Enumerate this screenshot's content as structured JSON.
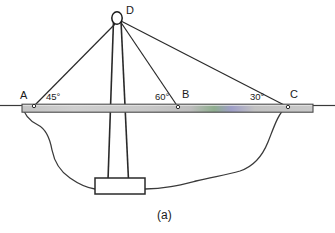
{
  "figure": {
    "caption": "(a)",
    "points": [
      {
        "id": "A",
        "label": "A",
        "x": 34,
        "y": 106,
        "label_x": 20,
        "label_y": 90
      },
      {
        "id": "B",
        "label": "B",
        "x": 178,
        "y": 107,
        "label_x": 182,
        "label_y": 89
      },
      {
        "id": "C",
        "label": "C",
        "x": 288,
        "y": 107,
        "label_x": 290,
        "label_y": 89
      },
      {
        "id": "D",
        "label": "D",
        "x": 120,
        "y": 19,
        "label_x": 126,
        "label_y": 5
      }
    ],
    "angles": [
      {
        "id": "angle-at-A",
        "label": "45°",
        "value": 45,
        "vertex": "A",
        "label_x": 46,
        "label_y": 92
      },
      {
        "id": "angle-at-B",
        "label": "60°",
        "value": 60,
        "vertex": "B",
        "label_x": 155,
        "label_y": 92
      },
      {
        "id": "angle-at-C",
        "label": "30°",
        "value": 30,
        "vertex": "C",
        "label_x": 250,
        "label_y": 92
      }
    ],
    "cables": [
      {
        "id": "cable-DA",
        "from": "D",
        "to": "A"
      },
      {
        "id": "cable-DB",
        "from": "D",
        "to": "B"
      },
      {
        "id": "cable-DC",
        "from": "D",
        "to": "C"
      }
    ],
    "elements": {
      "deck": {
        "name": "ship-deck",
        "x": 22,
        "y": 104,
        "width": 291,
        "height": 8
      },
      "mast": {
        "name": "ship-mast",
        "top_left_x": 113,
        "top_right_x": 121,
        "bottom_left_x": 108,
        "bottom_right_x": 128,
        "top_y": 21,
        "bottom_y": 179
      },
      "mast_top_ellipse": {
        "name": "mast-top-ring",
        "cx": 117,
        "cy": 18,
        "rx": 5,
        "ry": 6
      },
      "keel_box": {
        "name": "mast-base-box",
        "x": 95,
        "y": 178,
        "width": 50,
        "height": 16
      },
      "waterline_left": {
        "name": "waterline-left",
        "x1": 0,
        "y1": 105,
        "x2": 22,
        "y2": 105
      },
      "waterline_right": {
        "name": "waterline-right",
        "x1": 313,
        "y1": 105,
        "x2": 335,
        "y2": 105
      }
    },
    "colors": {
      "stroke": "#2a2a2a",
      "deck_fill": "#c9c9c9",
      "deck_accent_green": "#6f9a6f",
      "deck_accent_blue": "#7b7bbf",
      "background": "#ffffff",
      "text": "#1a1a1a"
    }
  }
}
